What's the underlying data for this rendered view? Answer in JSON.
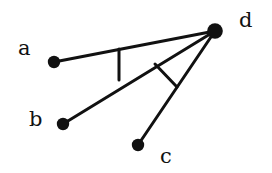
{
  "figure": {
    "background_color": "#ffffff",
    "stroke_color": "#111111",
    "width": 272,
    "height": 173
  },
  "vertices": [
    {
      "id": "a",
      "label": "a",
      "x": 54,
      "y": 62,
      "dot_radius": 6.2,
      "label_x": 18,
      "label_y": 38
    },
    {
      "id": "b",
      "label": "b",
      "x": 63,
      "y": 124,
      "dot_radius": 6.2,
      "label_x": 29,
      "label_y": 109
    },
    {
      "id": "c",
      "label": "c",
      "x": 138,
      "y": 145,
      "dot_radius": 6.2,
      "label_x": 160,
      "label_y": 146
    },
    {
      "id": "d",
      "label": "d",
      "x": 215,
      "y": 31,
      "dot_radius": 7.8,
      "label_x": 239,
      "label_y": 10
    }
  ],
  "edges": [
    {
      "id": "edge-ad",
      "from": "a",
      "to": "d",
      "x1": 54,
      "y1": 62,
      "x2": 215,
      "y2": 31,
      "stroke_width": 3.0
    },
    {
      "id": "edge-bd",
      "from": "b",
      "to": "d",
      "x1": 63,
      "y1": 124,
      "x2": 215,
      "y2": 31,
      "stroke_width": 3.0
    },
    {
      "id": "edge-cd",
      "from": "c",
      "to": "d",
      "x1": 138,
      "y1": 145,
      "x2": 215,
      "y2": 31,
      "stroke_width": 3.0
    }
  ],
  "perpendicular_marks": [
    {
      "id": "mark-ad-to-bd",
      "description": "vertical segment from segment a-d down to segment b-d",
      "x1": 119,
      "y1": 49,
      "x2": 119,
      "y2": 80,
      "stroke_width": 3.0
    },
    {
      "id": "mark-bd-to-cd",
      "description": "segment from segment b-d down-right to segment c-d",
      "x1": 155,
      "y1": 64,
      "x2": 177,
      "y2": 87,
      "stroke_width": 3.0
    }
  ]
}
